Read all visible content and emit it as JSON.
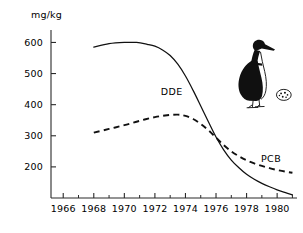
{
  "figure": {
    "background_color": "#ffffff",
    "line_color": "#111111",
    "illustration": {
      "name": "guillemot-with-egg",
      "description": "black and white seabird standing beside a speckled egg"
    }
  },
  "chart_data": {
    "type": "line",
    "title": "",
    "xlabel": "",
    "ylabel": "mg/kg",
    "ylabel_text": "mg/kg",
    "xlim": [
      1965.2,
      1981.3
    ],
    "ylim": [
      100,
      640
    ],
    "grid": false,
    "legend": "inline-labels",
    "y_ticks": [
      200,
      300,
      400,
      500,
      600
    ],
    "y_tick_labels": [
      "200",
      "300",
      "400",
      "500",
      "600"
    ],
    "x_ticks": [
      1966,
      1968,
      1970,
      1972,
      1974,
      1976,
      1978,
      1980
    ],
    "x_tick_labels": [
      "1966",
      "1968",
      "1970",
      "1972",
      "1974",
      "1976",
      "1978",
      "1980"
    ],
    "x_minor_ticks": [
      1967,
      1969,
      1971,
      1973,
      1975,
      1977,
      1979,
      1981
    ],
    "series": [
      {
        "name": "DDE",
        "label": "DDE",
        "style": "solid",
        "x": [
          1968.0,
          1969.0,
          1970.0,
          1970.8,
          1971.5,
          1972.0,
          1972.5,
          1973.0,
          1973.5,
          1974.0,
          1974.5,
          1975.0,
          1975.5,
          1976.0,
          1976.5,
          1977.0,
          1977.5,
          1978.0,
          1978.5,
          1979.0,
          1979.5,
          1980.0,
          1980.5,
          1981.0
        ],
        "values": [
          585,
          596,
          600,
          600,
          594,
          588,
          576,
          558,
          530,
          492,
          446,
          396,
          345,
          296,
          255,
          222,
          197,
          176,
          160,
          147,
          136,
          126,
          118,
          110
        ]
      },
      {
        "name": "PCB",
        "label": "PCB",
        "style": "dashed",
        "x": [
          1968.0,
          1969.0,
          1970.0,
          1971.0,
          1972.0,
          1972.8,
          1973.5,
          1974.0,
          1974.5,
          1975.0,
          1975.5,
          1976.0,
          1976.5,
          1977.0,
          1977.5,
          1978.0,
          1978.5,
          1979.0,
          1979.5,
          1980.0,
          1980.5,
          1981.0
        ],
        "values": [
          310,
          322,
          334,
          348,
          360,
          366,
          368,
          364,
          354,
          338,
          318,
          294,
          270,
          250,
          234,
          221,
          211,
          203,
          196,
          190,
          185,
          181
        ]
      }
    ],
    "annotations": [
      {
        "text": "DDE",
        "x": 1973.1,
        "y": 432
      },
      {
        "text": "PCB",
        "x": 1979.6,
        "y": 216
      }
    ]
  }
}
